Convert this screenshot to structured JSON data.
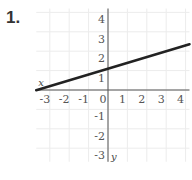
{
  "problem_number": "1.",
  "chart_data": {
    "type": "line",
    "title": "",
    "xlabel": "x",
    "ylabel": "y",
    "xlim": [
      -3.7,
      4.2
    ],
    "ylim": [
      -3.7,
      4.2
    ],
    "x_ticks": [
      "-3",
      "-2",
      "-1",
      "0",
      "1",
      "2",
      "3",
      "4"
    ],
    "y_ticks": [
      "4",
      "3",
      "2",
      "1",
      "-1",
      "-2",
      "-3"
    ],
    "grid": true,
    "series": [
      {
        "name": "line",
        "x": [
          -3.7,
          4.2
        ],
        "y": [
          -0.01,
          2.36
        ],
        "equation": "y = 0.3x + 1.1",
        "color": "#222222"
      }
    ]
  }
}
